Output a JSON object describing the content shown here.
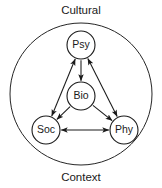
{
  "diagram": {
    "type": "node-link-diagram",
    "boundary": {
      "shape": "circle",
      "cx": 81,
      "cy": 94,
      "r": 71,
      "stroke_color": "#262626"
    },
    "outer_labels": {
      "top": "Cultural",
      "bottom": "Context"
    },
    "nodes": [
      {
        "id": "psy",
        "label": "Psy",
        "cx": 81,
        "cy": 45,
        "r": 14
      },
      {
        "id": "bio",
        "label": "Bio",
        "cx": 81,
        "cy": 96,
        "r": 14
      },
      {
        "id": "soc",
        "label": "Soc",
        "cx": 46,
        "cy": 130,
        "r": 14
      },
      {
        "id": "phy",
        "label": "Phy",
        "cx": 124,
        "cy": 130,
        "r": 14
      }
    ],
    "edges": [
      {
        "id": "psy-soc",
        "from": "psy",
        "to": "soc",
        "direction": "bidirectional"
      },
      {
        "id": "psy-phy",
        "from": "psy",
        "to": "phy",
        "direction": "bidirectional"
      },
      {
        "id": "soc-phy",
        "from": "soc",
        "to": "phy",
        "direction": "bidirectional"
      },
      {
        "id": "psy-bio",
        "from": "psy",
        "to": "bio",
        "direction": "forward"
      },
      {
        "id": "bio-soc",
        "from": "bio",
        "to": "soc",
        "direction": "forward"
      },
      {
        "id": "bio-phy",
        "from": "bio",
        "to": "phy",
        "direction": "forward"
      }
    ],
    "colors": {
      "background": "#ffffff",
      "stroke": "#1a1a1a",
      "text": "#1a1a1a"
    }
  }
}
